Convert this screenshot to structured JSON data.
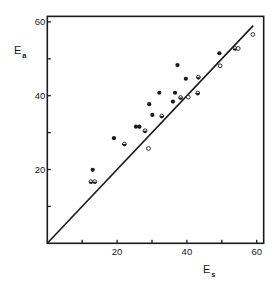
{
  "chart_data": {
    "type": "scatter",
    "title": "",
    "xlabel": "E",
    "xlabel_subscript": "s",
    "ylabel": "E",
    "ylabel_subscript": "a",
    "xlim": [
      0,
      62
    ],
    "ylim": [
      0,
      61.5
    ],
    "xticks": [
      0,
      10,
      20,
      30,
      40,
      50,
      60
    ],
    "xtick_labels": [
      "",
      "",
      "20",
      "",
      "40",
      "",
      "60"
    ],
    "yticks": [
      0,
      10,
      20,
      30,
      40,
      50,
      60
    ],
    "ytick_labels": [
      "",
      "",
      "20",
      "",
      "40",
      "",
      "60"
    ],
    "grid": false,
    "legend": null,
    "reference_line": {
      "label": "y = x",
      "from": [
        0,
        0
      ],
      "to": [
        59,
        59
      ]
    },
    "series": [
      {
        "name": "filled",
        "marker": "filled-circle",
        "points": [
          [
            49.3,
            51.5
          ],
          [
            37.3,
            48.3
          ],
          [
            39.7,
            44.6
          ],
          [
            32.1,
            40.8
          ],
          [
            36.6,
            40.8
          ],
          [
            36.0,
            38.4
          ],
          [
            29.2,
            37.7
          ],
          [
            30.1,
            34.8
          ],
          [
            25.4,
            31.6
          ],
          [
            26.4,
            31.6
          ],
          [
            19.1,
            28.5
          ],
          [
            13.0,
            19.9
          ]
        ]
      },
      {
        "name": "half-filled",
        "marker": "half-circle",
        "points": [
          [
            53.8,
            52.8
          ],
          [
            43.3,
            45.0
          ],
          [
            43.1,
            40.7
          ],
          [
            38.2,
            39.5
          ],
          [
            32.8,
            34.5
          ],
          [
            28.0,
            30.5
          ],
          [
            22.1,
            26.9
          ],
          [
            12.5,
            16.7
          ],
          [
            13.6,
            16.7
          ]
        ]
      },
      {
        "name": "open",
        "marker": "open-circle",
        "points": [
          [
            58.9,
            56.6
          ],
          [
            54.7,
            52.8
          ],
          [
            49.5,
            48.1
          ],
          [
            40.4,
            39.6
          ],
          [
            29.0,
            25.7
          ]
        ]
      }
    ]
  },
  "colors": {
    "ink": "#1a1a1a",
    "background": "#ffffff"
  }
}
